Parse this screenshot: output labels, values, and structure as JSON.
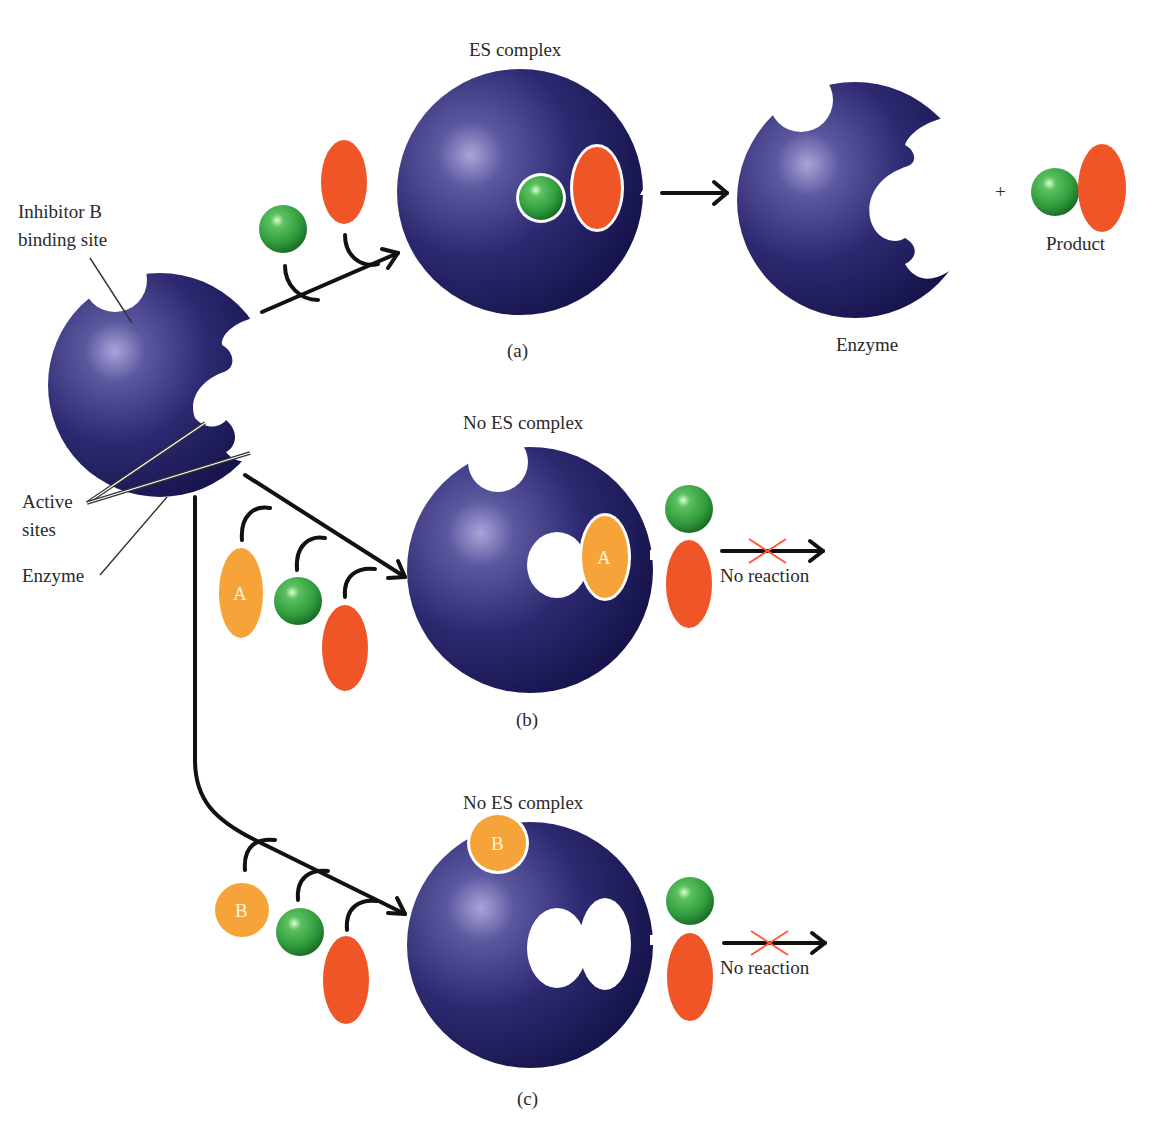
{
  "colors": {
    "enzyme": "#2a2766",
    "enzyme_highlight": "#8c88c4",
    "enzyme_shadow": "#16144a",
    "substrate_green": "#2f9a3c",
    "substrate_green_highlight": "#b8f0b8",
    "substrate_red": "#ef5527",
    "inhibitor_orange": "#f6a43a",
    "arrow": "#111111",
    "no_reaction_cross": "#ff5a3a",
    "text": "#2a2a2a"
  },
  "labels": {
    "inhibitor_b_site_line1": "Inhibitor B",
    "inhibitor_b_site_line2": "binding site",
    "active_sites_line1": "Active",
    "active_sites_line2": "sites",
    "enzyme_left": "Enzyme"
  },
  "panel_a": {
    "title": "ES complex",
    "caption": "(a)",
    "result_enzyme_label": "Enzyme",
    "plus": "+",
    "product_label": "Product"
  },
  "panel_b": {
    "title": "No ES complex",
    "caption": "(b)",
    "inhibitor_letter": "A",
    "no_reaction": "No reaction"
  },
  "panel_c": {
    "title": "No ES complex",
    "caption": "(c)",
    "inhibitor_letter": "B",
    "no_reaction": "No reaction"
  }
}
